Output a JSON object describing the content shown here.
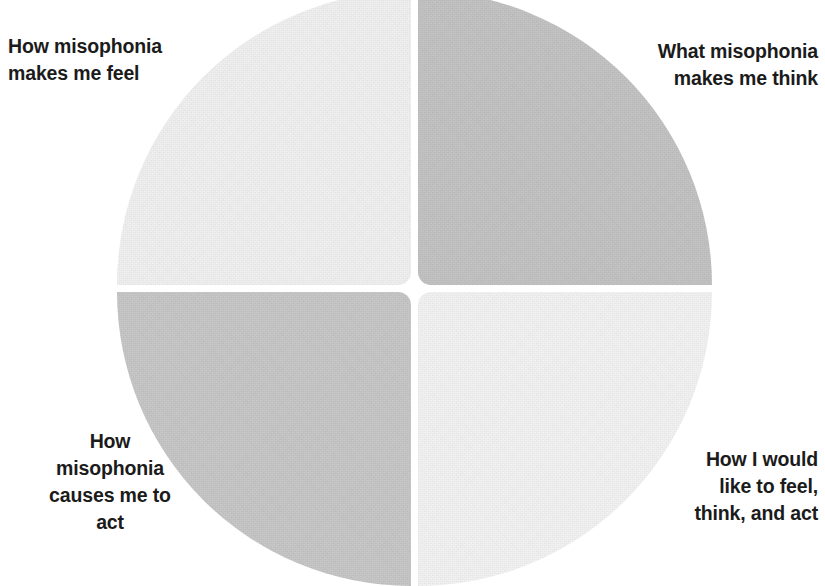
{
  "diagram": {
    "type": "quadrant-circle",
    "shape": "circle divided into four quadrants by a white cross-shaped gap",
    "background_color": "#ffffff",
    "text_color": "#1b1b1b",
    "quadrants": [
      {
        "id": "top-left",
        "label": "How misophonia\nmakes me feel",
        "fill_color": "#f1f1f1",
        "position": "top-left"
      },
      {
        "id": "top-right",
        "label": "What misophonia\nmakes me think",
        "fill_color": "#c2c2c2",
        "position": "top-right"
      },
      {
        "id": "bottom-left",
        "label": "How\nmisophonia\ncauses me to\nact",
        "fill_color": "#c6c6c6",
        "position": "bottom-left"
      },
      {
        "id": "bottom-right",
        "label": "How I would\nlike to feel,\nthink, and act",
        "fill_color": "#f3f3f3",
        "position": "bottom-right"
      }
    ]
  }
}
